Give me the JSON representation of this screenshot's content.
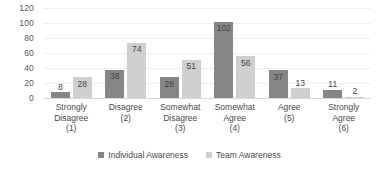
{
  "chart_data": {
    "type": "bar",
    "title": "",
    "subtitle": "",
    "xlabel": "",
    "ylabel": "",
    "ylim": [
      0,
      120
    ],
    "ytick_step": 20,
    "yticks": [
      120,
      100,
      80,
      60,
      40,
      20,
      0
    ],
    "grid": true,
    "grid_axis": "y",
    "legend_position": "bottom-center",
    "categories": [
      "Strongly Disagree (1)",
      "Disagree (2)",
      "Somewhat Disagree (3)",
      "Somewhat Agree (4)",
      "Agree (5)",
      "Strongly Agree (6)"
    ],
    "category_lines": [
      [
        "Strongly",
        "Disagree",
        "(1)"
      ],
      [
        "Disagree",
        "(2)"
      ],
      [
        "Somewhat",
        "Disagree",
        "(3)"
      ],
      [
        "Somewhat",
        "Agree",
        "(4)"
      ],
      [
        "Agree",
        "(5)"
      ],
      [
        "Strongly",
        "Agree",
        "(6)"
      ]
    ],
    "series": [
      {
        "name": "Individual Awareness",
        "color": "#868686",
        "values": [
          8,
          38,
          28,
          102,
          37,
          11
        ]
      },
      {
        "name": "Team Awareness",
        "color": "#cfcfcf",
        "values": [
          28,
          74,
          51,
          56,
          13,
          2
        ]
      }
    ]
  },
  "colors": {
    "series_individual": "#868686",
    "series_team": "#cfcfcf",
    "gridline": "#f0f0f0",
    "baseline": "#d9d9d9",
    "text": "#4a4a4a",
    "background": "#ffffff"
  }
}
